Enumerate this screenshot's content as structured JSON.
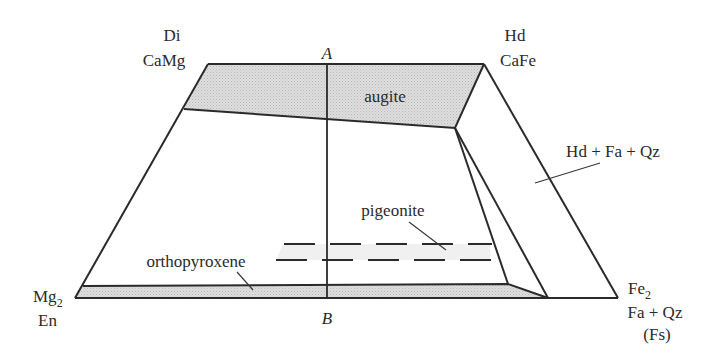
{
  "diagram": {
    "type": "pyroxene quadrilateral (Di-Hd-En-Fs)",
    "corners": {
      "top_left": {
        "line1": "Di",
        "line2": "CaMg"
      },
      "top_right": {
        "line1": "Hd",
        "line2": "CaFe"
      },
      "bottom_left": {
        "line1": "Mg",
        "sub": "2",
        "line2": "En"
      },
      "bottom_right": {
        "line1": "Fe",
        "sub": "2",
        "line2": "Fa + Qz",
        "line3": "(Fs)"
      }
    },
    "section_line": {
      "top_label": "A",
      "bottom_label": "B"
    },
    "fields": {
      "augite": "augite",
      "pigeonite": "pigeonite",
      "orthopyroxene": "orthopyroxene",
      "hd_fa_qz": "Hd + Fa + Qz"
    },
    "colors": {
      "line": "#2a2a2a",
      "shade": "#d6d6d6",
      "background": "#ffffff"
    }
  }
}
